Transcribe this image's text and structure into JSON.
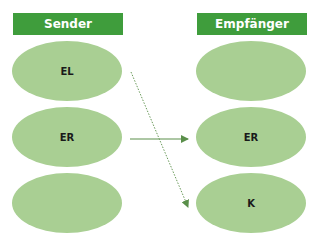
{
  "colors": {
    "header_bg": "#3f9d3c",
    "header_text": "#ffffff",
    "node_fill": "#a9cf93",
    "arrow": "#5a8f4a"
  },
  "sender": {
    "title": "Sender",
    "nodes": [
      {
        "label": "EL"
      },
      {
        "label": "ER"
      },
      {
        "label": ""
      }
    ]
  },
  "receiver": {
    "title": "Empfänger",
    "nodes": [
      {
        "label": ""
      },
      {
        "label": "ER"
      },
      {
        "label": "K"
      }
    ]
  },
  "edges": [
    {
      "from": "sender.EL",
      "to": "receiver.K",
      "style": "dotted"
    },
    {
      "from": "sender.ER",
      "to": "receiver.ER",
      "style": "solid"
    }
  ]
}
